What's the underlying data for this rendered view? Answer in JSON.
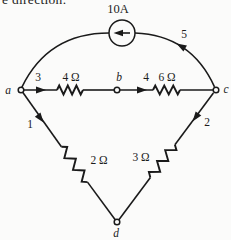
{
  "colors": {
    "ink": "#1a1a1a",
    "paper": "#fbfbfa"
  },
  "cropped_text": {
    "fragment": "e direction."
  },
  "circuit": {
    "source": {
      "value": "10A",
      "type": "current-source",
      "arrow_icon": "left-arrow"
    },
    "nodes": {
      "a": "a",
      "b": "b",
      "c": "c",
      "d": "d"
    },
    "branches": {
      "n1": "1",
      "n2": "2",
      "n3": "3",
      "n4": "4",
      "n5": "5"
    },
    "resistors": {
      "r_ab": "4 Ω",
      "r_bc": "6 Ω",
      "r_ad": "2 Ω",
      "r_cd": "3 Ω"
    }
  }
}
